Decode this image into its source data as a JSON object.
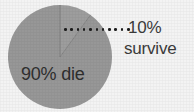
{
  "chart_data": {
    "type": "pie",
    "title": "",
    "categories": [
      "die",
      "survive"
    ],
    "values": [
      90,
      10
    ],
    "labels": [
      "90% die",
      "10% survive"
    ],
    "series": [
      {
        "name": "outcome",
        "values": [
          90,
          10
        ]
      }
    ],
    "slices": [
      {
        "name": "die",
        "label": "90% die",
        "value": 90,
        "unit": "%",
        "color": "#979797",
        "start_angle_deg": 36,
        "end_angle_deg": 360
      },
      {
        "name": "survive",
        "label": "10% survive",
        "value": 10,
        "unit": "%",
        "color": "#9d9d9d",
        "start_angle_deg": 0,
        "end_angle_deg": 36
      }
    ],
    "legend": "none",
    "grid": false,
    "xlabel": "",
    "ylabel": ""
  },
  "figure": {
    "background_color": "#f3f3f3",
    "pie_color": "#979797",
    "pie_slice_divider_color": "#7e7e7e",
    "text_color": "#3b3b3b",
    "inner_text_color": "#2f2f2f",
    "leader_dot_color": "#1c1c1c",
    "leader_dot_count": 11
  },
  "labels": {
    "survive_percent": "10%",
    "survive_word": "survive",
    "die": "90% die"
  }
}
